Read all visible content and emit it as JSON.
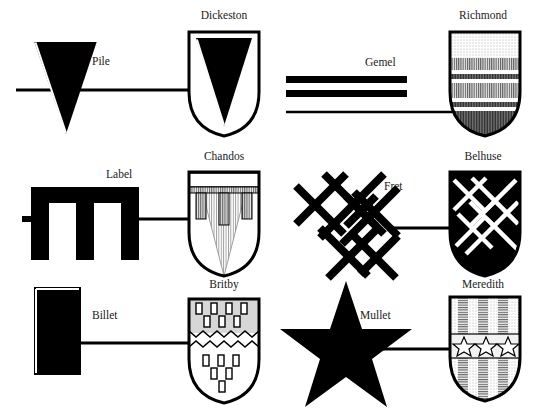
{
  "page": {
    "background": "#ffffff",
    "ink": "#000000",
    "text_color": "#1a1a1a",
    "width": 549,
    "height": 411
  },
  "entries": [
    {
      "charge_label": "Pile",
      "shield_name": "Dickeston",
      "charge_icon": "pile-charge",
      "shield_icon": "shield-dickeston",
      "row": 1,
      "column": 1,
      "blazon_note": "Argent, a pile sable"
    },
    {
      "charge_label": "Gemel",
      "shield_name": "Richmond",
      "charge_icon": "gemel-charge",
      "shield_icon": "shield-richmond",
      "row": 1,
      "column": 2,
      "blazon_note": "Barry with bars gemel"
    },
    {
      "charge_label": "Label",
      "shield_name": "Chandos",
      "charge_icon": "label-charge",
      "shield_icon": "shield-chandos",
      "row": 2,
      "column": 1,
      "blazon_note": "A pile, a label of three points"
    },
    {
      "charge_label": "Fret",
      "shield_name": "Belhuse",
      "charge_icon": "fret-charge",
      "shield_icon": "shield-belhuse",
      "row": 2,
      "column": 2,
      "blazon_note": "Sable, a fret argent"
    },
    {
      "charge_label": "Billet",
      "shield_name": "Britby",
      "charge_icon": "billet-charge",
      "shield_icon": "shield-britby",
      "row": 3,
      "column": 1,
      "blazon_note": "Billetty, per fess dancetty"
    },
    {
      "charge_label": "Mullet",
      "shield_name": "Meredith",
      "charge_icon": "mullet-charge",
      "shield_icon": "shield-meredith",
      "row": 3,
      "column": 2,
      "blazon_note": "Paly, on a fess three mullets"
    }
  ]
}
